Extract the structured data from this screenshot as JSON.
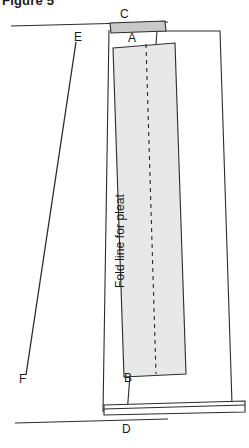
{
  "figure": {
    "caption": "Figure 5",
    "fold_line_text": "Fold line for pleat",
    "colors": {
      "stroke": "#2b2b2b",
      "panel_fill": "#e8e8e8",
      "band_fill": "#c9c9c9",
      "background": "#ffffff"
    }
  },
  "points": {
    "A": {
      "label": "A",
      "x": 128,
      "y": 38
    },
    "B": {
      "label": "B",
      "x": 124,
      "y": 378
    },
    "C": {
      "label": "C",
      "x": 120,
      "y": 14
    },
    "D": {
      "label": "D",
      "x": 122,
      "y": 429
    },
    "E": {
      "label": "E",
      "x": 74,
      "y": 37
    },
    "F": {
      "label": "F",
      "x": 19,
      "y": 379
    }
  },
  "geometry": {
    "top_guide_line": {
      "x1": 11,
      "y1": 26,
      "x2": 168,
      "y2": 22
    },
    "bottom_guide_line": {
      "x1": 15,
      "y1": 423,
      "x2": 168,
      "y2": 419
    },
    "ef_diagonal": {
      "x1": 76,
      "y1": 42,
      "x2": 26,
      "y2": 375
    },
    "outer_quad": "157,31 220,31 232,404 127,414",
    "inner_panel": "113,48 175,43 186,374 124,377",
    "left_vertical": {
      "x1": 109,
      "y1": 30,
      "x2": 103,
      "y2": 412
    },
    "top_band": "110,23 165,21 166,31 111,33",
    "bottom_band": "104,405 245,401 245,412 104,415",
    "dashed_fold": {
      "x1": 146,
      "y1": 44,
      "x2": 156,
      "y2": 374
    }
  }
}
